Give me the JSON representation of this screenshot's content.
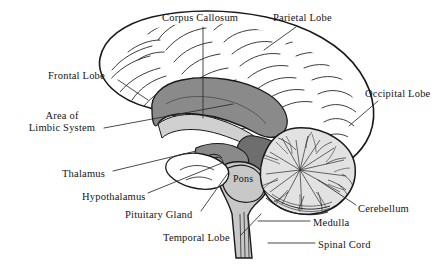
{
  "figure": {
    "style": "engraved line drawing, black and white with gray shading",
    "background_color": "#ffffff",
    "line_color": "#1a1a1a",
    "text_color": "#141414"
  },
  "palette": {
    "corpus_callosum_gray": "#8a8a8a",
    "brainstem_gray": "#c8c8c8",
    "midbrain_gray": "#707070",
    "cerebellum_gray": "#d8d8d8",
    "cortex_fill": "#ffffff",
    "leader_line": "#2b2b2b"
  },
  "labels": [
    {
      "id": "corpus-callosum",
      "text": "Corpus Callosum",
      "x": 162,
      "y": 12,
      "lines": [
        "Corpus Callosum"
      ]
    },
    {
      "id": "parietal-lobe",
      "text": "Parietal Lobe",
      "x": 273,
      "y": 12,
      "lines": [
        "Parietal Lobe"
      ]
    },
    {
      "id": "frontal-lobe",
      "text": "Frontal Lobe",
      "x": 48,
      "y": 70,
      "lines": [
        "Frontal Lobe"
      ]
    },
    {
      "id": "occipital-lobe",
      "text": "Occipital Lobe",
      "x": 365,
      "y": 88,
      "lines": [
        "Occipital Lobe"
      ]
    },
    {
      "id": "area-limbic-system",
      "text": "Area of Limbic System",
      "x": 23,
      "y": 110,
      "lines": [
        "Area of",
        "Limbic System"
      ]
    },
    {
      "id": "thalamus",
      "text": "Thalamus",
      "x": 62,
      "y": 168,
      "lines": [
        "Thalamus"
      ]
    },
    {
      "id": "pons",
      "text": "Pons",
      "x": 233,
      "y": 173,
      "lines": [
        "Pons"
      ]
    },
    {
      "id": "hypothalamus",
      "text": "Hypothalamus",
      "x": 82,
      "y": 191,
      "lines": [
        "Hypothalamus"
      ]
    },
    {
      "id": "cerebellum",
      "text": "Cerebellum",
      "x": 358,
      "y": 203,
      "lines": [
        "Cerebellum"
      ]
    },
    {
      "id": "pituitary-gland",
      "text": "Pituitary Gland",
      "x": 125,
      "y": 209,
      "lines": [
        "Pituitary Gland"
      ]
    },
    {
      "id": "medulla",
      "text": "Medulla",
      "x": 313,
      "y": 217,
      "lines": [
        "Medulla"
      ]
    },
    {
      "id": "temporal-lobe",
      "text": "Temporal Lobe",
      "x": 163,
      "y": 232,
      "lines": [
        "Temporal Lobe"
      ]
    },
    {
      "id": "spinal-cord",
      "text": "Spinal Cord",
      "x": 318,
      "y": 239,
      "lines": [
        "Spinal Cord"
      ]
    }
  ],
  "leader_lines": [
    {
      "id": "corpus-callosum-leader",
      "points": "203,27 203,118"
    },
    {
      "id": "parietal-lobe-leader",
      "points": "296,27 264,50"
    },
    {
      "id": "frontal-lobe-leader",
      "points": "118,80 148,100"
    },
    {
      "id": "occipital-lobe-leader",
      "points": "378,101 349,126"
    },
    {
      "id": "limbic-system-leader",
      "points": "104,128 233,104"
    },
    {
      "id": "thalamus-leader",
      "points": "113,171 196,151"
    },
    {
      "id": "hypothalamus-leader",
      "points": "148,193 222,163"
    },
    {
      "id": "pituitary-gland-leader",
      "points": "201,211 228,173"
    },
    {
      "id": "temporal-lobe-leader",
      "points": "241,235 261,214"
    },
    {
      "id": "cerebellum-leader",
      "points": "356,205 318,180"
    },
    {
      "id": "medulla-leader",
      "points": "310,221 258,221"
    },
    {
      "id": "spinal-cord-leader",
      "points": "315,243 268,243"
    }
  ]
}
